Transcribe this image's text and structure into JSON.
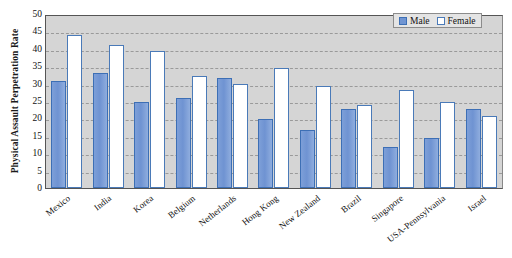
{
  "chart_data": {
    "type": "bar",
    "title": "",
    "xlabel": "",
    "ylabel": "Physical Assault Perpetration Rate",
    "ylim": [
      0,
      50
    ],
    "ytick_step": 5,
    "yticks": [
      0,
      5,
      10,
      15,
      20,
      25,
      30,
      35,
      40,
      45,
      50
    ],
    "grid": true,
    "legend_position": "top-right",
    "categories": [
      "Mexico",
      "India",
      "Korea",
      "Belgium",
      "Netherlands",
      "Hong Kong",
      "New Zealand",
      "Brazil",
      "Singapore",
      "USA-Pennsylvania",
      "Israel"
    ],
    "series": [
      {
        "name": "Male",
        "color": "#7095d2",
        "values": [
          30.7,
          33.1,
          24.6,
          25.9,
          31.5,
          19.8,
          16.8,
          22.6,
          11.9,
          14.4,
          22.7
        ]
      },
      {
        "name": "Female",
        "color": "#ffffff",
        "values": [
          44.0,
          41.0,
          39.3,
          32.3,
          29.8,
          34.6,
          29.3,
          23.9,
          28.1,
          24.6,
          20.7
        ]
      }
    ]
  },
  "colors": {
    "male_fill": "#7095d2",
    "male_border": "#3d6fb5",
    "female_fill": "#ffffff",
    "female_border": "#4a7ab8",
    "plot_background": "#d5d5d5",
    "gridline": "#9a9a9a",
    "axis": "#555555",
    "legend_background": "#e4e4e4",
    "text": "#111111"
  }
}
